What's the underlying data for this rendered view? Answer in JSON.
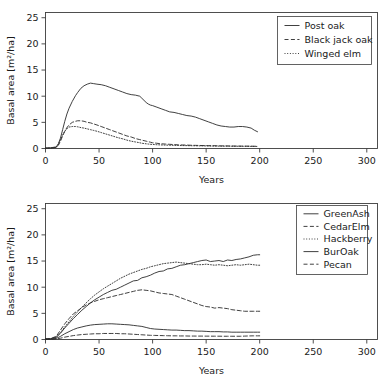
{
  "figure": {
    "panels": [
      "top",
      "bottom"
    ]
  },
  "chart_data": [
    {
      "type": "line",
      "panel": "top",
      "title": "",
      "xlabel": "Years",
      "ylabel": "Basal area [m²/ha]",
      "xlim": [
        0,
        310
      ],
      "ylim": [
        0,
        26
      ],
      "xticks": [
        0,
        50,
        100,
        150,
        200,
        250,
        300
      ],
      "xticklabels": [
        "0",
        "50",
        "100",
        "150",
        "200",
        "250",
        "300"
      ],
      "yticks": [
        0,
        5,
        10,
        15,
        20,
        25
      ],
      "yticklabels": [
        "0",
        "5",
        "10",
        "15",
        "20",
        "25"
      ],
      "grid": false,
      "legend_position": "upper right",
      "x": [
        0,
        5,
        10,
        12,
        14,
        16,
        18,
        20,
        22,
        25,
        28,
        30,
        33,
        36,
        39,
        42,
        45,
        48,
        52,
        56,
        60,
        64,
        68,
        72,
        76,
        80,
        84,
        88,
        90,
        92,
        94,
        96,
        98,
        100,
        104,
        108,
        112,
        116,
        120,
        124,
        128,
        132,
        136,
        140,
        144,
        148,
        152,
        156,
        160,
        164,
        168,
        172,
        176,
        180,
        184,
        188,
        192,
        195,
        198
      ],
      "series": [
        {
          "name": "Post oak",
          "style": "solid",
          "values": [
            0.1,
            0.15,
            0.3,
            0.9,
            2.0,
            3.6,
            5.2,
            6.6,
            7.7,
            9.0,
            10.1,
            10.7,
            11.5,
            12.0,
            12.3,
            12.5,
            12.4,
            12.3,
            12.2,
            12.0,
            11.7,
            11.4,
            11.1,
            10.8,
            10.5,
            10.3,
            10.2,
            10.0,
            9.6,
            9.2,
            8.8,
            8.5,
            8.3,
            8.2,
            7.9,
            7.6,
            7.3,
            7.0,
            6.9,
            6.7,
            6.5,
            6.3,
            6.2,
            6.0,
            5.7,
            5.4,
            5.1,
            4.8,
            4.5,
            4.3,
            4.2,
            4.1,
            4.1,
            4.2,
            4.2,
            4.1,
            3.9,
            3.5,
            3.2
          ]
        },
        {
          "name": "Black jack oak",
          "style": "dashed",
          "values": [
            0.05,
            0.08,
            0.2,
            0.6,
            1.4,
            2.4,
            3.3,
            4.0,
            4.5,
            5.0,
            5.2,
            5.3,
            5.3,
            5.2,
            5.0,
            4.9,
            4.7,
            4.5,
            4.2,
            3.9,
            3.6,
            3.3,
            3.0,
            2.7,
            2.4,
            2.2,
            1.9,
            1.7,
            1.6,
            1.5,
            1.4,
            1.3,
            1.2,
            1.1,
            1.0,
            0.9,
            0.85,
            0.8,
            0.75,
            0.7,
            0.68,
            0.65,
            0.62,
            0.6,
            0.58,
            0.56,
            0.55,
            0.54,
            0.52,
            0.5,
            0.5,
            0.48,
            0.47,
            0.46,
            0.45,
            0.45,
            0.44,
            0.43,
            0.42
          ]
        },
        {
          "name": "Winged elm",
          "style": "dotted",
          "values": [
            0.05,
            0.08,
            0.25,
            0.8,
            1.7,
            2.6,
            3.3,
            3.8,
            4.1,
            4.2,
            4.2,
            4.15,
            4.0,
            3.9,
            3.75,
            3.6,
            3.45,
            3.3,
            3.05,
            2.8,
            2.55,
            2.3,
            2.05,
            1.85,
            1.6,
            1.4,
            1.25,
            1.1,
            1.0,
            0.95,
            0.9,
            0.85,
            0.8,
            0.78,
            0.72,
            0.68,
            0.65,
            0.62,
            0.6,
            0.58,
            0.56,
            0.55,
            0.53,
            0.52,
            0.5,
            0.5,
            0.48,
            0.47,
            0.46,
            0.45,
            0.45,
            0.44,
            0.43,
            0.43,
            0.42,
            0.42,
            0.41,
            0.4,
            0.4
          ]
        }
      ]
    },
    {
      "type": "line",
      "panel": "bottom",
      "title": "",
      "xlabel": "Years",
      "ylabel": "Basal area [m²/ha]",
      "xlim": [
        0,
        310
      ],
      "ylim": [
        0,
        26
      ],
      "xticks": [
        0,
        50,
        100,
        150,
        200,
        250,
        300
      ],
      "xticklabels": [
        "0",
        "50",
        "100",
        "150",
        "200",
        "250",
        "300"
      ],
      "yticks": [
        0,
        5,
        10,
        15,
        20,
        25
      ],
      "yticklabels": [
        "0",
        "5",
        "10",
        "15",
        "20",
        "25"
      ],
      "grid": false,
      "legend_position": "upper right",
      "x": [
        0,
        5,
        10,
        14,
        18,
        22,
        26,
        30,
        34,
        38,
        42,
        46,
        50,
        54,
        58,
        62,
        66,
        70,
        74,
        78,
        82,
        86,
        90,
        94,
        98,
        102,
        106,
        110,
        114,
        118,
        122,
        126,
        130,
        134,
        138,
        142,
        146,
        150,
        154,
        158,
        162,
        166,
        170,
        174,
        178,
        182,
        186,
        190,
        194,
        198,
        200
      ],
      "series": [
        {
          "name": "GreenAsh",
          "style": "solid",
          "values": [
            0.1,
            0.15,
            0.4,
            1.2,
            2.2,
            3.1,
            4.0,
            4.8,
            5.6,
            6.3,
            7.0,
            7.6,
            8.1,
            8.6,
            9.0,
            9.4,
            9.6,
            10.0,
            10.4,
            10.8,
            11.2,
            11.3,
            11.8,
            12.0,
            12.3,
            12.7,
            13.0,
            13.1,
            13.5,
            13.6,
            13.9,
            14.2,
            14.3,
            14.5,
            14.7,
            14.9,
            15.1,
            15.2,
            14.9,
            15.0,
            15.1,
            14.9,
            15.2,
            15.1,
            15.3,
            15.4,
            15.6,
            15.8,
            16.1,
            16.2,
            16.2
          ]
        },
        {
          "name": "CedarElm",
          "style": "dashed",
          "values": [
            0.1,
            0.2,
            0.6,
            1.8,
            3.0,
            4.0,
            4.9,
            5.5,
            6.1,
            6.6,
            7.0,
            7.3,
            7.6,
            7.8,
            8.0,
            8.2,
            8.4,
            8.6,
            8.8,
            9.0,
            9.2,
            9.4,
            9.5,
            9.4,
            9.3,
            9.1,
            8.9,
            8.8,
            8.7,
            8.6,
            8.3,
            8.0,
            7.7,
            7.4,
            7.1,
            6.8,
            6.5,
            6.3,
            6.2,
            6.0,
            6.1,
            6.0,
            5.9,
            5.7,
            5.6,
            5.5,
            5.4,
            5.4,
            5.4,
            5.4,
            5.4
          ]
        },
        {
          "name": "Hackberry",
          "style": "dotted",
          "values": [
            0.1,
            0.15,
            0.45,
            1.3,
            2.4,
            3.4,
            4.4,
            5.3,
            6.2,
            7.0,
            7.8,
            8.5,
            9.1,
            9.7,
            10.2,
            10.7,
            11.2,
            11.7,
            12.1,
            12.5,
            12.8,
            13.1,
            13.4,
            13.6,
            13.9,
            14.1,
            14.3,
            14.5,
            14.6,
            14.7,
            14.8,
            14.7,
            14.6,
            14.5,
            14.4,
            14.3,
            14.3,
            14.4,
            14.3,
            14.2,
            14.3,
            14.2,
            14.1,
            14.2,
            14.3,
            14.2,
            14.3,
            14.4,
            14.3,
            14.2,
            14.2
          ]
        },
        {
          "name": "BurOak",
          "style": "solid",
          "values": [
            0.05,
            0.08,
            0.2,
            0.6,
            1.1,
            1.5,
            1.9,
            2.2,
            2.4,
            2.6,
            2.75,
            2.85,
            2.9,
            2.95,
            3.0,
            3.0,
            2.95,
            2.9,
            2.85,
            2.8,
            2.7,
            2.6,
            2.5,
            2.3,
            2.1,
            2.0,
            1.95,
            1.9,
            1.85,
            1.8,
            1.8,
            1.75,
            1.7,
            1.7,
            1.65,
            1.6,
            1.6,
            1.55,
            1.5,
            1.5,
            1.5,
            1.45,
            1.45,
            1.4,
            1.4,
            1.4,
            1.4,
            1.4,
            1.4,
            1.4,
            1.4
          ]
        },
        {
          "name": "Pecan",
          "style": "dashed",
          "values": [
            0.02,
            0.04,
            0.1,
            0.25,
            0.45,
            0.6,
            0.75,
            0.85,
            0.95,
            1.0,
            1.05,
            1.1,
            1.1,
            1.15,
            1.15,
            1.15,
            1.15,
            1.1,
            1.1,
            1.05,
            1.0,
            0.95,
            0.9,
            0.85,
            0.8,
            0.78,
            0.76,
            0.74,
            0.72,
            0.7,
            0.7,
            0.68,
            0.68,
            0.66,
            0.66,
            0.65,
            0.65,
            0.64,
            0.64,
            0.63,
            0.63,
            0.62,
            0.62,
            0.62,
            0.62,
            0.62,
            0.65,
            0.68,
            0.7,
            0.7,
            0.7
          ]
        }
      ]
    }
  ],
  "colors": {
    "background": "#ffffff",
    "line": "#2b2b2b",
    "axis": "#3c3c3c",
    "text": "#1a1a1a"
  }
}
